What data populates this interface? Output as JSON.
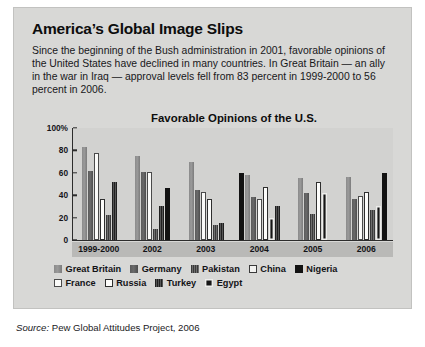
{
  "headline": "America’s Global Image Slips",
  "deck": "Since the beginning of the Bush administration in 2001, favorable opinions of the United States have declined in many countries. In Great Britain — an ally in the war in Iraq — approval levels fell from 83 percent in 1999-2000 to 56 percent in 2006.",
  "source": {
    "label": "Source:",
    "text": " Pew Global Attitudes Project, 2006"
  },
  "legend": {
    "row1": [
      {
        "name": "Great Britain",
        "key": "gb"
      },
      {
        "name": "Germany",
        "key": "germany"
      },
      {
        "name": "Pakistan",
        "key": "pakistan"
      },
      {
        "name": "China",
        "key": "china"
      },
      {
        "name": "Nigeria",
        "key": "nigeria"
      }
    ],
    "row2": [
      {
        "name": "France",
        "key": "france"
      },
      {
        "name": "Russia",
        "key": "russia"
      },
      {
        "name": "Turkey",
        "key": "turkey"
      },
      {
        "name": "Egypt",
        "key": "egypt"
      }
    ]
  },
  "chart_data": {
    "type": "bar",
    "title": "Favorable Opinions of the U.S.",
    "xlabel": "",
    "ylabel": "",
    "ylim": [
      0,
      100
    ],
    "yticks": [
      "100%",
      "80",
      "60",
      "40",
      "20",
      "0"
    ],
    "ytick_values": [
      100,
      80,
      60,
      40,
      20,
      0
    ],
    "grid": false,
    "legend_position": "bottom",
    "categories": [
      "1999-2000",
      "2002",
      "2003",
      "2004",
      "2005",
      "2006"
    ],
    "series": [
      {
        "name": "Great Britain",
        "key": "gb",
        "values": [
          83,
          75,
          70,
          58,
          55,
          56
        ]
      },
      {
        "name": "Germany",
        "key": "germany",
        "values": [
          62,
          61,
          45,
          38,
          42,
          37
        ]
      },
      {
        "name": "France",
        "key": "france",
        "values": [
          78,
          61,
          43,
          37,
          43,
          39
        ]
      },
      {
        "name": "Russia",
        "key": "russia",
        "values": [
          37,
          null,
          37,
          47,
          52,
          43
        ]
      },
      {
        "name": "Pakistan",
        "key": "pakistan",
        "values": [
          22,
          10,
          13,
          null,
          23,
          27
        ]
      },
      {
        "name": "Turkey",
        "key": "turkey",
        "values": [
          52,
          30,
          15,
          30,
          23,
          12
        ]
      },
      {
        "name": "Nigeria",
        "key": "nigeria",
        "values": [
          null,
          46,
          null,
          60,
          null,
          60
        ]
      },
      {
        "name": "Egypt",
        "key": "egypt",
        "values": [
          null,
          null,
          null,
          20,
          42,
          30
        ]
      },
      {
        "name": "China",
        "key": "china",
        "values": [
          null,
          null,
          null,
          null,
          null,
          null
        ]
      }
    ],
    "groups": [
      {
        "category": "1999-2000",
        "bars": [
          {
            "key": "gb",
            "name": "Great Britain",
            "value": 83
          },
          {
            "key": "germany",
            "name": "Germany",
            "value": 62
          },
          {
            "key": "france",
            "name": "France",
            "value": 78
          },
          {
            "key": "russia",
            "name": "Russia",
            "value": 37
          },
          {
            "key": "pakistan",
            "name": "Pakistan",
            "value": 22
          },
          {
            "key": "turkey",
            "name": "Turkey",
            "value": 52
          }
        ]
      },
      {
        "category": "2002",
        "bars": [
          {
            "key": "gb",
            "name": "Great Britain",
            "value": 75
          },
          {
            "key": "germany",
            "name": "Germany",
            "value": 61
          },
          {
            "key": "france",
            "name": "France",
            "value": 61
          },
          {
            "key": "pakistan",
            "name": "Pakistan",
            "value": 10
          },
          {
            "key": "turkey",
            "name": "Turkey",
            "value": 30
          },
          {
            "key": "nigeria",
            "name": "Nigeria",
            "value": 46
          }
        ]
      },
      {
        "category": "2003",
        "bars": [
          {
            "key": "gb",
            "name": "Great Britain",
            "value": 70
          },
          {
            "key": "germany",
            "name": "Germany",
            "value": 45
          },
          {
            "key": "france",
            "name": "France",
            "value": 43
          },
          {
            "key": "russia",
            "name": "Russia",
            "value": 37
          },
          {
            "key": "pakistan",
            "name": "Pakistan",
            "value": 13
          },
          {
            "key": "turkey",
            "name": "Turkey",
            "value": 15
          }
        ]
      },
      {
        "category": "2004",
        "bars": [
          {
            "key": "nigeria",
            "name": "Nigeria",
            "value": 60
          },
          {
            "key": "gb",
            "name": "Great Britain",
            "value": 58
          },
          {
            "key": "germany",
            "name": "Germany",
            "value": 38
          },
          {
            "key": "france",
            "name": "France",
            "value": 37
          },
          {
            "key": "russia",
            "name": "Russia",
            "value": 47
          },
          {
            "key": "egypt",
            "name": "Egypt",
            "value": 20
          },
          {
            "key": "turkey",
            "name": "Turkey",
            "value": 30
          }
        ]
      },
      {
        "category": "2005",
        "bars": [
          {
            "key": "gb",
            "name": "Great Britain",
            "value": 55
          },
          {
            "key": "germany",
            "name": "Germany",
            "value": 42
          },
          {
            "key": "pakistan",
            "name": "Pakistan",
            "value": 23
          },
          {
            "key": "russia",
            "name": "Russia",
            "value": 52
          },
          {
            "key": "egypt",
            "name": "Egypt",
            "value": 42
          }
        ]
      },
      {
        "category": "2006",
        "bars": [
          {
            "key": "gb",
            "name": "Great Britain",
            "value": 56
          },
          {
            "key": "germany",
            "name": "Germany",
            "value": 37
          },
          {
            "key": "france",
            "name": "France",
            "value": 39
          },
          {
            "key": "russia",
            "name": "Russia",
            "value": 43
          },
          {
            "key": "pakistan",
            "name": "Pakistan",
            "value": 27
          },
          {
            "key": "egypt",
            "name": "Egypt",
            "value": 30
          },
          {
            "key": "nigeria",
            "name": "Nigeria",
            "value": 60
          }
        ]
      }
    ]
  }
}
